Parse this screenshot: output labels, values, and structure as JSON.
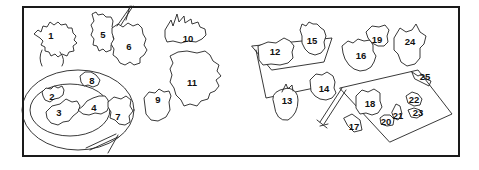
{
  "figure": {
    "labels": [
      {
        "id": "1",
        "x": 51,
        "y": 36
      },
      {
        "id": "2",
        "x": 52,
        "y": 97
      },
      {
        "id": "3",
        "x": 59,
        "y": 113
      },
      {
        "id": "4",
        "x": 94,
        "y": 108
      },
      {
        "id": "5",
        "x": 103,
        "y": 35
      },
      {
        "id": "6",
        "x": 129,
        "y": 47
      },
      {
        "id": "7",
        "x": 118,
        "y": 117
      },
      {
        "id": "8",
        "x": 92,
        "y": 81
      },
      {
        "id": "9",
        "x": 158,
        "y": 100
      },
      {
        "id": "10",
        "x": 188,
        "y": 39
      },
      {
        "id": "11",
        "x": 192,
        "y": 83
      },
      {
        "id": "12",
        "x": 275,
        "y": 52
      },
      {
        "id": "13",
        "x": 287,
        "y": 101
      },
      {
        "id": "14",
        "x": 324,
        "y": 89
      },
      {
        "id": "15",
        "x": 312,
        "y": 41
      },
      {
        "id": "16",
        "x": 361,
        "y": 56
      },
      {
        "id": "17",
        "x": 354,
        "y": 127
      },
      {
        "id": "18",
        "x": 370,
        "y": 104
      },
      {
        "id": "19",
        "x": 377,
        "y": 40
      },
      {
        "id": "20",
        "x": 386,
        "y": 122
      },
      {
        "id": "21",
        "x": 398,
        "y": 116
      },
      {
        "id": "22",
        "x": 414,
        "y": 100
      },
      {
        "id": "23",
        "x": 418,
        "y": 113
      },
      {
        "id": "24",
        "x": 410,
        "y": 42
      },
      {
        "id": "25",
        "x": 425,
        "y": 77
      }
    ]
  }
}
